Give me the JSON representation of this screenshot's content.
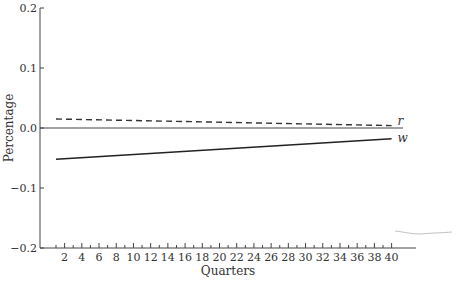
{
  "chart_data": {
    "type": "line",
    "title": "",
    "xlabel": "Quarters",
    "ylabel": "Percentage",
    "xlim": [
      0,
      42
    ],
    "ylim": [
      -0.2,
      0.2
    ],
    "yticks": [
      -0.2,
      -0.1,
      0.0,
      0.1,
      0.2
    ],
    "ytick_labels": [
      "−0.2",
      "−0.1",
      "0.0",
      "0.1",
      "0.2"
    ],
    "xticks_minor": [
      1,
      2,
      3,
      4,
      5,
      6,
      7,
      8,
      9,
      10,
      11,
      12,
      13,
      14,
      15,
      16,
      17,
      18,
      19,
      20,
      21,
      22,
      23,
      24,
      25,
      26,
      27,
      28,
      29,
      30,
      31,
      32,
      33,
      34,
      35,
      36,
      37,
      38,
      39,
      40
    ],
    "xticks_labeled": [
      2,
      4,
      6,
      8,
      10,
      12,
      14,
      16,
      18,
      20,
      22,
      24,
      26,
      28,
      30,
      32,
      34,
      36,
      38,
      40
    ],
    "zero_line": true,
    "grid": false,
    "series": [
      {
        "name": "r",
        "style": "dashed",
        "color": "#333333",
        "x": [
          1,
          40
        ],
        "values": [
          0.015,
          0.004
        ]
      },
      {
        "name": "w",
        "style": "solid",
        "color": "#222222",
        "x": [
          1,
          40
        ],
        "values": [
          -0.052,
          -0.018
        ]
      }
    ],
    "legend": "inline labels at right end of lines"
  }
}
